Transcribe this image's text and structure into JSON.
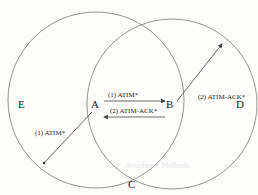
{
  "diagram": {
    "nodes": [
      {
        "id": "A",
        "label": "A",
        "x": 95,
        "y": 103
      },
      {
        "id": "B",
        "label": "B",
        "x": 170,
        "y": 103
      },
      {
        "id": "C",
        "label": "C",
        "x": 132,
        "y": 188
      },
      {
        "id": "D",
        "label": "D",
        "x": 240,
        "y": 103
      },
      {
        "id": "E",
        "label": "E",
        "x": 20,
        "y": 105
      }
    ],
    "circles": [
      {
        "name": "range-of-A",
        "cx": 96,
        "cy": 100,
        "r": 88
      },
      {
        "name": "range-of-B",
        "cx": 172,
        "cy": 104,
        "r": 85
      }
    ],
    "messages": [
      {
        "label": "(1) ATIM*",
        "from": "A",
        "to": "B"
      },
      {
        "label": "(2) ATIM-ACK*",
        "from": "B",
        "to": "A"
      },
      {
        "label": "(2) ATIM-ACK*",
        "from": "B",
        "to": "edge-of-B"
      },
      {
        "label": "(1) ATIM*",
        "from": "A",
        "to": "edge-of-A"
      }
    ],
    "colors": {
      "stroke": "#555555",
      "text": "#222222",
      "background": "#fdfdfc"
    }
  },
  "background_text": {
    "note": "faint bleed-through text",
    "line": "Avoidance Methods"
  }
}
